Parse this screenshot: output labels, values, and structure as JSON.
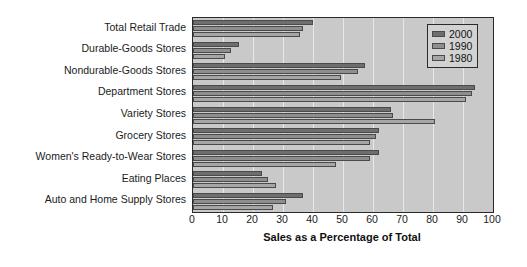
{
  "chart_data": {
    "type": "bar",
    "orientation": "horizontal",
    "title": "",
    "xlabel": "Sales as a Percentage of Total",
    "ylabel": "",
    "xlim": [
      0,
      100
    ],
    "xticks": [
      0,
      10,
      20,
      30,
      40,
      50,
      60,
      70,
      80,
      90,
      100
    ],
    "grid": true,
    "grid_axis": "x",
    "legend_position": "top-right",
    "categories": [
      "Total Retail Trade",
      "Durable-Goods Stores",
      "Nondurable-Goods Stores",
      "Department Stores",
      "Variety Stores",
      "Grocery Stores",
      "Women's Ready-to-Wear Stores",
      "Eating Places",
      "Auto and Home Supply Stores"
    ],
    "series": [
      {
        "name": "2000",
        "color": "#6e6e6e",
        "values": [
          40,
          15.3,
          57.3,
          94,
          66,
          62,
          62,
          23,
          36.5
        ]
      },
      {
        "name": "1990",
        "color": "#8e8e8e",
        "values": [
          36.7,
          12.7,
          55,
          93,
          66.5,
          61,
          59,
          25,
          31
        ]
      },
      {
        "name": "1980",
        "color": "#a6a6a6",
        "values": [
          35.5,
          10.7,
          49.3,
          91,
          80.5,
          59,
          47.5,
          27.5,
          26.5
        ]
      }
    ]
  },
  "legend": {
    "entries": [
      {
        "label": "2000"
      },
      {
        "label": "1990"
      },
      {
        "label": "1980"
      }
    ]
  },
  "colors": {
    "plot_background": "#c9c9c9",
    "gridline": "#e8e8e8",
    "axis": "#2a2a2a",
    "bar_edge": "#4a4a4a",
    "text": "#1b1b1b"
  }
}
